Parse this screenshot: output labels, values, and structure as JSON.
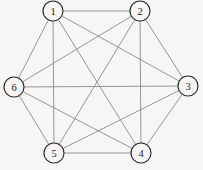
{
  "figure": {
    "width": 203,
    "height": 170,
    "background_color": "#f7f6f4"
  },
  "style": {
    "edge_color": "#8a8a8a",
    "edge_width": 0.9,
    "node_fill": "#f7f6f4",
    "node_stroke": "#2b2b2b",
    "node_stroke_width": 1.15,
    "node_radius": 10,
    "label_color": "#1a1a1a"
  },
  "chart_data": {
    "type": "diagram",
    "graph_type": "complete-graph",
    "name": "K6",
    "title": "",
    "xlabel": "",
    "ylabel": "",
    "node_count": 6,
    "edge_count": 15,
    "directed": false,
    "weighted": false,
    "layout": "hexagonal-circular",
    "nodes": [
      {
        "id": "1",
        "label": "1",
        "x": 53,
        "y": 11,
        "r": 10
      },
      {
        "id": "2",
        "label": "2",
        "x": 140,
        "y": 11,
        "r": 10
      },
      {
        "id": "3",
        "label": "3",
        "x": 188,
        "y": 86,
        "r": 10
      },
      {
        "id": "4",
        "label": "4",
        "x": 141,
        "y": 153,
        "r": 10
      },
      {
        "id": "5",
        "label": "5",
        "x": 54,
        "y": 153,
        "r": 10
      },
      {
        "id": "6",
        "label": "6",
        "x": 14,
        "y": 87,
        "r": 10
      }
    ],
    "edges": [
      {
        "source": "1",
        "target": "2",
        "kind": "hexagon-side"
      },
      {
        "source": "2",
        "target": "3",
        "kind": "hexagon-side"
      },
      {
        "source": "3",
        "target": "4",
        "kind": "hexagon-side"
      },
      {
        "source": "4",
        "target": "5",
        "kind": "hexagon-side"
      },
      {
        "source": "5",
        "target": "6",
        "kind": "hexagon-side"
      },
      {
        "source": "6",
        "target": "1",
        "kind": "hexagon-side"
      },
      {
        "source": "1",
        "target": "3",
        "kind": "short-diagonal"
      },
      {
        "source": "1",
        "target": "5",
        "kind": "short-diagonal"
      },
      {
        "source": "2",
        "target": "4",
        "kind": "short-diagonal"
      },
      {
        "source": "2",
        "target": "6",
        "kind": "short-diagonal"
      },
      {
        "source": "3",
        "target": "5",
        "kind": "short-diagonal"
      },
      {
        "source": "4",
        "target": "6",
        "kind": "short-diagonal"
      },
      {
        "source": "1",
        "target": "4",
        "kind": "long-diagonal"
      },
      {
        "source": "2",
        "target": "5",
        "kind": "long-diagonal"
      },
      {
        "source": "3",
        "target": "6",
        "kind": "long-diagonal"
      }
    ]
  }
}
